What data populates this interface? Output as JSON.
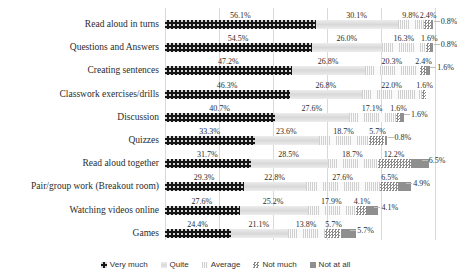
{
  "chart_data": {
    "type": "bar",
    "orientation": "horizontal",
    "stacked": true,
    "stack_mode": "percent",
    "title": "",
    "subtitle": "",
    "xlabel": "",
    "ylabel": "",
    "xlim": [
      0,
      100
    ],
    "grid": true,
    "gridline_values": [
      0,
      20,
      40,
      60,
      80,
      100
    ],
    "legend_position": "bottom",
    "value_label_suffix": "%",
    "categories": [
      "Read aloud in turns",
      "Questions and Answers",
      "Creating sentences",
      "Classwork exercises/drills",
      "Discussion",
      "Quizzes",
      "Read aloud together",
      "Pair/group work (Breakout room)",
      "Watching videos online",
      "Games"
    ],
    "series": [
      {
        "name": "Very much",
        "color": "#151515",
        "pattern": "dotted-dark",
        "values": [
          56.1,
          54.5,
          47.2,
          46.3,
          40.7,
          33.3,
          31.7,
          29.3,
          27.6,
          24.4
        ],
        "labels": [
          "56.1%",
          "54.5%",
          "47.2%",
          "46.3%",
          "40.7%",
          "33.3%",
          "31.7%",
          "29.3%",
          "27.6%",
          "24.4%"
        ]
      },
      {
        "name": "Quite",
        "color": "#e2e2e2",
        "pattern": "solid-light-gray",
        "values": [
          30.1,
          26.0,
          26.8,
          26.8,
          27.6,
          23.6,
          28.5,
          22.8,
          25.2,
          21.1
        ],
        "labels": [
          "30.1%",
          "26.0%",
          "26.8%",
          "26.8%",
          "27.6%",
          "23.6%",
          "28.5%",
          "22.8%",
          "25.2%",
          "21.1%"
        ]
      },
      {
        "name": "Average",
        "color": "#f0f0f0",
        "pattern": "vertical-lines",
        "values": [
          9.8,
          16.3,
          20.3,
          22.0,
          17.1,
          18.7,
          18.7,
          27.6,
          17.9,
          13.8
        ],
        "labels": [
          "9.8%",
          "16.3%",
          "20.3%",
          "22.0%",
          "17.1%",
          "18.7%",
          "18.7%",
          "27.6%",
          "17.9%",
          "13.8%"
        ]
      },
      {
        "name": "Not much",
        "color": "#8a8a8a",
        "pattern": "checkerboard",
        "values": [
          2.4,
          1.6,
          2.4,
          1.6,
          1.6,
          5.7,
          12.2,
          6.5,
          4.1,
          5.7
        ],
        "labels": [
          "2.4%",
          "1.6%",
          "2.4%",
          "1.6%",
          "1.6%",
          "5.7%",
          "12.2%",
          "6.5%",
          "4.1%",
          "5.7%"
        ]
      },
      {
        "name": "Not at all",
        "color": "#8f8f8f",
        "pattern": "solid-gray",
        "values": [
          0.8,
          0.8,
          1.6,
          0.0,
          1.6,
          0.8,
          6.5,
          4.9,
          4.1,
          5.7
        ],
        "labels": [
          "0.8%",
          "0.8%",
          "1.6%",
          "",
          "1.6%",
          "0.8%",
          "6.5%",
          "4.9%",
          "4.1%",
          "5.7%"
        ]
      }
    ]
  },
  "legend": {
    "items": [
      {
        "label": "Very much",
        "swatch": "legend-swatch-very-much"
      },
      {
        "label": "Quite",
        "swatch": "legend-swatch-quite"
      },
      {
        "label": "Average",
        "swatch": "legend-swatch-average"
      },
      {
        "label": "Not much",
        "swatch": "legend-swatch-not-much"
      },
      {
        "label": "Not at all",
        "swatch": "legend-swatch-not-at-all"
      }
    ]
  }
}
